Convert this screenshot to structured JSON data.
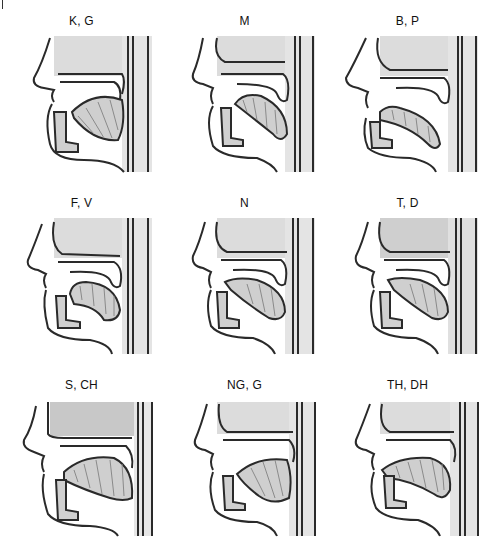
{
  "figure": {
    "panels": [
      {
        "label": "K, G",
        "place": "velar",
        "lips": "open",
        "tongue": "back-raised"
      },
      {
        "label": "M",
        "place": "bilabial",
        "lips": "closed",
        "tongue": "low"
      },
      {
        "label": "B, P",
        "place": "bilabial",
        "lips": "closed",
        "tongue": "low"
      },
      {
        "label": "F, V",
        "place": "labiodental",
        "lips": "lower-lip-to-teeth",
        "tongue": "low"
      },
      {
        "label": "N",
        "place": "alveolar",
        "lips": "open",
        "tongue": "tip-raised"
      },
      {
        "label": "T, D",
        "place": "alveolar",
        "lips": "open",
        "tongue": "tip-raised"
      },
      {
        "label": "S, CH",
        "place": "alveolar",
        "lips": "open",
        "tongue": "blade-raised"
      },
      {
        "label": "NG, G",
        "place": "velar",
        "lips": "open",
        "tongue": "back-raised"
      },
      {
        "label": "TH, DH",
        "place": "dental",
        "lips": "open",
        "tongue": "tip-between-teeth"
      }
    ]
  },
  "colors": {
    "line": "#2a2a2a",
    "shade": "#d9d9d9",
    "shade_dark": "#bdbdbd",
    "tongue_hatch": "#8a8a8a",
    "background": "#ffffff"
  }
}
